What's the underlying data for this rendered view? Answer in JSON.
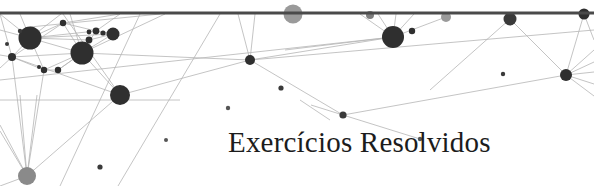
{
  "banner": {
    "title": "Exercícios Resolvidos",
    "width": 594,
    "height": 186,
    "background_color": "#ffffff",
    "title_color": "#1c1c1c",
    "title_x": 228,
    "title_y": 152,
    "title_font_size": 29
  },
  "graphic": {
    "kind": "network-graph-decoration",
    "node_color_dark": "#2f2f2f",
    "node_color_mid": "#4a4a4a",
    "node_color_gray": "#9a9a9a",
    "edge_color": "#b5b5b5",
    "bar_color": "#4a4a4a",
    "bar": {
      "x1": 0,
      "y1": 13,
      "x2": 594,
      "y2": 13,
      "thickness": 3
    },
    "edges": [
      {
        "x1": 0,
        "y1": 14,
        "x2": 30,
        "y2": 38
      },
      {
        "x1": 0,
        "y1": 14,
        "x2": 12,
        "y2": 57
      },
      {
        "x1": 0,
        "y1": 30,
        "x2": 30,
        "y2": 38
      },
      {
        "x1": 0,
        "y1": 55,
        "x2": 12,
        "y2": 57
      },
      {
        "x1": 0,
        "y1": 68,
        "x2": 12,
        "y2": 57
      },
      {
        "x1": 12,
        "y1": 57,
        "x2": 30,
        "y2": 38
      },
      {
        "x1": 12,
        "y1": 57,
        "x2": 82,
        "y2": 53
      },
      {
        "x1": 12,
        "y1": 57,
        "x2": 63,
        "y2": 23
      },
      {
        "x1": 12,
        "y1": 57,
        "x2": 120,
        "y2": 95
      },
      {
        "x1": 12,
        "y1": 57,
        "x2": 27,
        "y2": 176
      },
      {
        "x1": 12,
        "y1": 57,
        "x2": 44,
        "y2": 70
      },
      {
        "x1": 30,
        "y1": 38,
        "x2": 63,
        "y2": 23
      },
      {
        "x1": 30,
        "y1": 38,
        "x2": 82,
        "y2": 53
      },
      {
        "x1": 30,
        "y1": 38,
        "x2": 89,
        "y2": 40
      },
      {
        "x1": 30,
        "y1": 38,
        "x2": 96,
        "y2": 31
      },
      {
        "x1": 30,
        "y1": 38,
        "x2": 113,
        "y2": 34
      },
      {
        "x1": 30,
        "y1": 38,
        "x2": 44,
        "y2": 70
      },
      {
        "x1": 30,
        "y1": 38,
        "x2": 20,
        "y2": 14
      },
      {
        "x1": 30,
        "y1": 38,
        "x2": 61,
        "y2": 14
      },
      {
        "x1": 30,
        "y1": 27,
        "x2": 160,
        "y2": 14
      },
      {
        "x1": 63,
        "y1": 23,
        "x2": 82,
        "y2": 53
      },
      {
        "x1": 63,
        "y1": 23,
        "x2": 96,
        "y2": 31
      },
      {
        "x1": 63,
        "y1": 23,
        "x2": 120,
        "y2": 14
      },
      {
        "x1": 82,
        "y1": 53,
        "x2": 89,
        "y2": 40
      },
      {
        "x1": 82,
        "y1": 53,
        "x2": 96,
        "y2": 31
      },
      {
        "x1": 82,
        "y1": 53,
        "x2": 113,
        "y2": 34
      },
      {
        "x1": 82,
        "y1": 53,
        "x2": 120,
        "y2": 95
      },
      {
        "x1": 82,
        "y1": 53,
        "x2": 44,
        "y2": 70
      },
      {
        "x1": 82,
        "y1": 53,
        "x2": 58,
        "y2": 70
      },
      {
        "x1": 82,
        "y1": 53,
        "x2": 70,
        "y2": 14
      },
      {
        "x1": 82,
        "y1": 53,
        "x2": 250,
        "y2": 60
      },
      {
        "x1": 82,
        "y1": 53,
        "x2": 165,
        "y2": 14
      },
      {
        "x1": 44,
        "y1": 70,
        "x2": 58,
        "y2": 70
      },
      {
        "x1": 44,
        "y1": 70,
        "x2": 27,
        "y2": 176
      },
      {
        "x1": 58,
        "y1": 70,
        "x2": 82,
        "y2": 53
      },
      {
        "x1": 96,
        "y1": 31,
        "x2": 113,
        "y2": 34
      },
      {
        "x1": 96,
        "y1": 31,
        "x2": 120,
        "y2": 14
      },
      {
        "x1": 89,
        "y1": 40,
        "x2": 113,
        "y2": 34
      },
      {
        "x1": 120,
        "y1": 95,
        "x2": 250,
        "y2": 60
      },
      {
        "x1": 120,
        "y1": 95,
        "x2": 27,
        "y2": 176
      },
      {
        "x1": 120,
        "y1": 95,
        "x2": 63,
        "y2": 14
      },
      {
        "x1": 27,
        "y1": 176,
        "x2": 20,
        "y2": 95
      },
      {
        "x1": 27,
        "y1": 176,
        "x2": 37,
        "y2": 95
      },
      {
        "x1": 27,
        "y1": 176,
        "x2": 0,
        "y2": 125
      },
      {
        "x1": 27,
        "y1": 176,
        "x2": 0,
        "y2": 131
      },
      {
        "x1": 27,
        "y1": 176,
        "x2": 0,
        "y2": 186
      },
      {
        "x1": 250,
        "y1": 60,
        "x2": 238,
        "y2": 14
      },
      {
        "x1": 250,
        "y1": 60,
        "x2": 255,
        "y2": 14
      },
      {
        "x1": 250,
        "y1": 60,
        "x2": 343,
        "y2": 115
      },
      {
        "x1": 250,
        "y1": 60,
        "x2": 393,
        "y2": 37
      },
      {
        "x1": 250,
        "y1": 60,
        "x2": 594,
        "y2": 30
      },
      {
        "x1": 343,
        "y1": 115,
        "x2": 420,
        "y2": 139
      },
      {
        "x1": 343,
        "y1": 115,
        "x2": 566,
        "y2": 75
      },
      {
        "x1": 393,
        "y1": 37,
        "x2": 360,
        "y2": 14
      },
      {
        "x1": 393,
        "y1": 37,
        "x2": 378,
        "y2": 14
      },
      {
        "x1": 393,
        "y1": 37,
        "x2": 396,
        "y2": 14
      },
      {
        "x1": 393,
        "y1": 37,
        "x2": 414,
        "y2": 14
      },
      {
        "x1": 393,
        "y1": 37,
        "x2": 446,
        "y2": 17
      },
      {
        "x1": 393,
        "y1": 37,
        "x2": 285,
        "y2": 50
      },
      {
        "x1": 393,
        "y1": 37,
        "x2": 0,
        "y2": 80
      },
      {
        "x1": 510,
        "y1": 19,
        "x2": 566,
        "y2": 75
      },
      {
        "x1": 510,
        "y1": 19,
        "x2": 430,
        "y2": 90
      },
      {
        "x1": 566,
        "y1": 75,
        "x2": 584,
        "y2": 14
      },
      {
        "x1": 566,
        "y1": 75,
        "x2": 594,
        "y2": 50
      },
      {
        "x1": 566,
        "y1": 75,
        "x2": 594,
        "y2": 62
      },
      {
        "x1": 566,
        "y1": 75,
        "x2": 594,
        "y2": 72
      },
      {
        "x1": 566,
        "y1": 75,
        "x2": 594,
        "y2": 84
      },
      {
        "x1": 566,
        "y1": 75,
        "x2": 594,
        "y2": 96
      },
      {
        "x1": 584,
        "y1": 14,
        "x2": 594,
        "y2": 40
      },
      {
        "x1": 220,
        "y1": 14,
        "x2": 118,
        "y2": 186
      },
      {
        "x1": 140,
        "y1": 14,
        "x2": 60,
        "y2": 186
      },
      {
        "x1": 300,
        "y1": 100,
        "x2": 330,
        "y2": 120
      },
      {
        "x1": 311,
        "y1": 105,
        "x2": 343,
        "y2": 115
      },
      {
        "x1": 0,
        "y1": 100,
        "x2": 180,
        "y2": 100
      }
    ],
    "nodes": [
      {
        "cx": 30,
        "cy": 38,
        "r": 11.5,
        "color": "#2f2f2f"
      },
      {
        "cx": 82,
        "cy": 53,
        "r": 11.5,
        "color": "#2f2f2f"
      },
      {
        "cx": 120,
        "cy": 95,
        "r": 10,
        "color": "#2f2f2f"
      },
      {
        "cx": 393,
        "cy": 37,
        "r": 11,
        "color": "#2f2f2f"
      },
      {
        "cx": 113,
        "cy": 34,
        "r": 6.5,
        "color": "#2f2f2f"
      },
      {
        "cx": 12,
        "cy": 57,
        "r": 4,
        "color": "#2f2f2f"
      },
      {
        "cx": 63,
        "cy": 23,
        "r": 3.2,
        "color": "#2f2f2f"
      },
      {
        "cx": 89,
        "cy": 40,
        "r": 3.4,
        "color": "#2f2f2f"
      },
      {
        "cx": 96,
        "cy": 31,
        "r": 3.4,
        "color": "#2f2f2f"
      },
      {
        "cx": 89,
        "cy": 32,
        "r": 2.4,
        "color": "#2f2f2f"
      },
      {
        "cx": 103,
        "cy": 33,
        "r": 2.6,
        "color": "#2f2f2f"
      },
      {
        "cx": 44,
        "cy": 70,
        "r": 3.2,
        "color": "#2f2f2f"
      },
      {
        "cx": 58,
        "cy": 70,
        "r": 3.2,
        "color": "#2f2f2f"
      },
      {
        "cx": 39,
        "cy": 67,
        "r": 2.0,
        "color": "#2f2f2f"
      },
      {
        "cx": 27,
        "cy": 176,
        "r": 9,
        "color": "#8a8a8a"
      },
      {
        "cx": 250,
        "cy": 60,
        "r": 5,
        "color": "#2f2f2f"
      },
      {
        "cx": 281,
        "cy": 88,
        "r": 2.6,
        "color": "#3a3a3a"
      },
      {
        "cx": 343,
        "cy": 115,
        "r": 3.6,
        "color": "#3a3a3a"
      },
      {
        "cx": 420,
        "cy": 139,
        "r": 2.2,
        "color": "#555555"
      },
      {
        "cx": 412,
        "cy": 31,
        "r": 3.2,
        "color": "#2f2f2f"
      },
      {
        "cx": 446,
        "cy": 17,
        "r": 5,
        "color": "#9a9a9a"
      },
      {
        "cx": 293,
        "cy": 14,
        "r": 9.5,
        "color": "#9a9a9a"
      },
      {
        "cx": 370,
        "cy": 15,
        "r": 4,
        "color": "#7d7d7d"
      },
      {
        "cx": 510,
        "cy": 19,
        "r": 6.5,
        "color": "#3a3a3a"
      },
      {
        "cx": 566,
        "cy": 75,
        "r": 6,
        "color": "#2f2f2f"
      },
      {
        "cx": 584,
        "cy": 14,
        "r": 5.5,
        "color": "#2f2f2f"
      },
      {
        "cx": 503,
        "cy": 74,
        "r": 2.2,
        "color": "#3a3a3a"
      },
      {
        "cx": 166,
        "cy": 140,
        "r": 2.0,
        "color": "#555555"
      },
      {
        "cx": 100,
        "cy": 167,
        "r": 2.6,
        "color": "#3a3a3a"
      },
      {
        "cx": 228,
        "cy": 108,
        "r": 2.2,
        "color": "#555555"
      },
      {
        "cx": 20,
        "cy": 31,
        "r": 2.2,
        "color": "#3a3a3a"
      },
      {
        "cx": 7,
        "cy": 44,
        "r": 2.0,
        "color": "#3a3a3a"
      }
    ]
  }
}
